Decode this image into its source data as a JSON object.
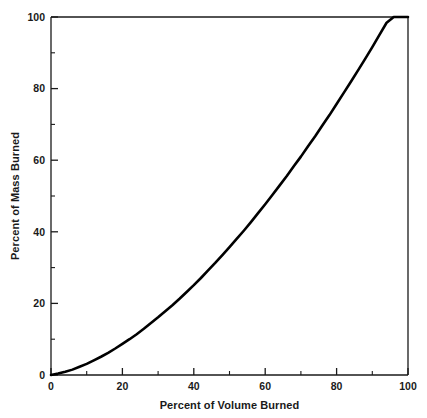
{
  "chart_data": {
    "type": "line",
    "title": "",
    "subtitle": "",
    "xlabel": "Percent of Volume Burned",
    "ylabel": "Percent of Mass Burned",
    "xlim": [
      0,
      100
    ],
    "ylim": [
      0,
      100
    ],
    "xticks": [
      0,
      20,
      40,
      60,
      80,
      100
    ],
    "yticks": [
      0,
      20,
      40,
      60,
      80,
      100
    ],
    "xtick_labels": [
      "0",
      "20",
      "40",
      "60",
      "80",
      "100"
    ],
    "ytick_labels": [
      "0",
      "20",
      "40",
      "60",
      "80",
      "100"
    ],
    "xminor_ticks": [
      10,
      30,
      50,
      70,
      90
    ],
    "yminor_ticks": [
      10,
      30,
      50,
      70,
      90
    ],
    "grid": false,
    "legend": null,
    "legend_position": "none",
    "annotations": [],
    "line_color": "#000000",
    "series": [
      {
        "name": "Mass vs Volume Burned",
        "x": [
          0,
          2,
          4,
          6,
          8,
          10,
          12,
          14,
          16,
          18,
          20,
          22,
          24,
          26,
          28,
          30,
          32,
          34,
          36,
          38,
          40,
          42,
          44,
          46,
          48,
          50,
          52,
          54,
          56,
          58,
          60,
          62,
          64,
          66,
          68,
          70,
          72,
          74,
          76,
          78,
          80,
          82,
          84,
          86,
          88,
          90,
          92,
          94,
          96,
          98,
          100
        ],
        "y": [
          0,
          0.4,
          0.9,
          1.5,
          2.3,
          3.1,
          4.1,
          5.1,
          6.2,
          7.4,
          8.7,
          10.0,
          11.4,
          12.9,
          14.5,
          16.1,
          17.8,
          19.5,
          21.3,
          23.2,
          25.1,
          27.1,
          29.2,
          31.3,
          33.5,
          35.7,
          38.0,
          40.3,
          42.7,
          45.2,
          47.7,
          50.3,
          52.9,
          55.5,
          58.3,
          61.0,
          63.9,
          66.7,
          69.7,
          72.6,
          75.7,
          78.8,
          81.9,
          85.1,
          88.3,
          91.6,
          95.0,
          98.4,
          101.8,
          105.3,
          100
        ]
      }
    ]
  }
}
